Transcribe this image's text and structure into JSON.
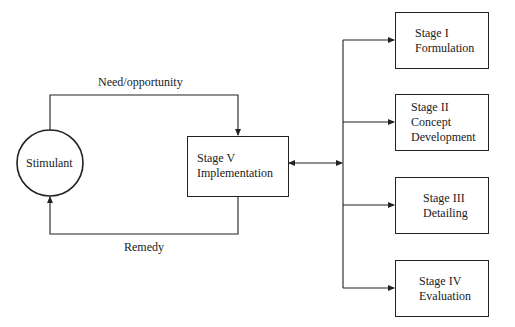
{
  "diagram": {
    "nodes": {
      "stimulant": {
        "label": "Stimulant",
        "shape": "circle"
      },
      "stage5": {
        "lines": [
          "Stage V",
          "Implementation"
        ]
      },
      "stage1": {
        "lines": [
          "Stage I",
          "Formulation"
        ]
      },
      "stage2": {
        "lines": [
          "Stage II",
          "Concept",
          "Development"
        ]
      },
      "stage3": {
        "lines": [
          "Stage III",
          "Detailing"
        ]
      },
      "stage4": {
        "lines": [
          "Stage IV",
          "Evaluation"
        ]
      }
    },
    "edges": [
      {
        "from": "stimulant",
        "to": "stage5",
        "label": "Need/opportunity"
      },
      {
        "from": "stage5",
        "to": "stimulant",
        "label": "Remedy"
      },
      {
        "from": "stage5",
        "to": "branch",
        "label": "",
        "bidirectional": true
      },
      {
        "from": "branch",
        "to": "stage1",
        "label": ""
      },
      {
        "from": "branch",
        "to": "stage2",
        "label": ""
      },
      {
        "from": "branch",
        "to": "stage3",
        "label": ""
      },
      {
        "from": "branch",
        "to": "stage4",
        "label": ""
      }
    ],
    "edge_labels": {
      "need": "Need/opportunity",
      "remedy": "Remedy"
    },
    "line_color": "#222222"
  }
}
